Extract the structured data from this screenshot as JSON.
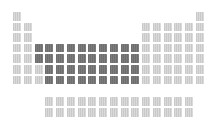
{
  "figure": {
    "highlighted_block": "d-block (transition metals)",
    "colors": {
      "light_cell": "#d2d2d2",
      "dark_cell": "#757575",
      "background": "#ffffff"
    }
  },
  "grid": {
    "origin_x": 13,
    "origin_y": 12,
    "pitch_x": 10.75,
    "pitch_y": 10.6,
    "f_rows_y": [
      97,
      108
    ]
  },
  "rows": [
    {
      "period": 1,
      "light": [
        1,
        18
      ],
      "dark": []
    },
    {
      "period": 2,
      "light": [
        1,
        2,
        13,
        14,
        15,
        16,
        17,
        18
      ],
      "dark": []
    },
    {
      "period": 3,
      "light": [
        1,
        2,
        13,
        14,
        15,
        16,
        17,
        18
      ],
      "dark": []
    },
    {
      "period": 4,
      "light": [
        1,
        2,
        13,
        14,
        15,
        16,
        17,
        18
      ],
      "dark": [
        3,
        4,
        5,
        6,
        7,
        8,
        9,
        10,
        11,
        12
      ]
    },
    {
      "period": 5,
      "light": [
        1,
        2,
        13,
        14,
        15,
        16,
        17,
        18
      ],
      "dark": [
        3,
        4,
        5,
        6,
        7,
        8,
        9,
        10,
        11,
        12
      ]
    },
    {
      "period": 6,
      "light": [
        1,
        2,
        3,
        13,
        14,
        15,
        16,
        17,
        18
      ],
      "dark": [
        4,
        5,
        6,
        7,
        8,
        9,
        10,
        11,
        12
      ]
    },
    {
      "period": 7,
      "light": [
        1,
        2,
        3,
        13,
        14,
        15,
        16,
        17,
        18
      ],
      "dark": [
        4,
        5,
        6,
        7,
        8,
        9,
        10,
        11,
        12
      ]
    }
  ],
  "f_block": [
    {
      "series": "lanthanides",
      "cols": [
        4,
        5,
        6,
        7,
        8,
        9,
        10,
        11,
        12,
        13,
        14,
        15,
        16,
        17
      ]
    },
    {
      "series": "actinides",
      "cols": [
        4,
        5,
        6,
        7,
        8,
        9,
        10,
        11,
        12,
        13,
        14,
        15,
        16,
        17
      ]
    }
  ]
}
